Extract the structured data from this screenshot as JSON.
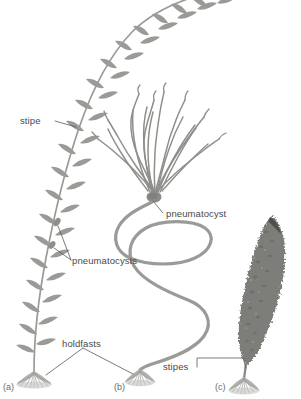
{
  "figure": {
    "kind": "scientific-illustration",
    "background_color": "#ffffff",
    "ink_color": "#8c8c8c",
    "dark_ink_color": "#6e6e6e",
    "text_color": "#4a4a4a",
    "blade_color": "#9a9a96",
    "kelp_blade_color": "#7d7d79"
  },
  "labels": {
    "stipe": "stipe",
    "pneumatocysts": "pneumatocysts",
    "pneumatocyst": "pneumatocyst",
    "holdfasts": "holdfasts",
    "stipes": "stipes"
  },
  "panels": [
    {
      "id": "a",
      "label": "(a)",
      "description": "long arching stipe with many leaf-like blades and small pneumatocysts"
    },
    {
      "id": "b",
      "label": "(b)",
      "description": "long sinuous stipe topped by a pneumatocyst bearing wavy branching fronds"
    },
    {
      "id": "c",
      "label": "(c)",
      "description": "single broad textured blade on a short stipe"
    }
  ],
  "annotations": [
    {
      "name": "stipe",
      "text": "stipe",
      "points_to": "panel-a-stipe"
    },
    {
      "name": "pneumatocysts",
      "text": "pneumatocysts",
      "points_to": "panel-a-bladders"
    },
    {
      "name": "pneumatocyst",
      "text": "pneumatocyst",
      "points_to": "panel-b-float"
    },
    {
      "name": "holdfasts",
      "text": "holdfasts",
      "points_to": "panel-a-holdfast and panel-b-holdfast"
    },
    {
      "name": "stipes",
      "text": "stipes",
      "points_to": "panel-b-stipe and panel-c-stipe"
    }
  ]
}
